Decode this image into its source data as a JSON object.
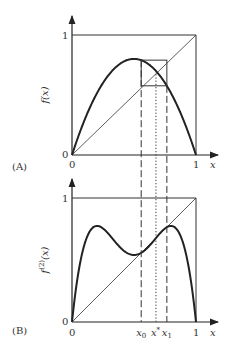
{
  "figure": {
    "panel_a": {
      "tag": "(A)",
      "ylabel": "f(x)",
      "xlabel": "x",
      "y_ticks": [
        "0",
        "1"
      ],
      "x_ticks": [
        "0",
        "1"
      ],
      "map": "logistic",
      "r": 3.1
    },
    "panel_b": {
      "tag": "(B)",
      "ylabel_main": "f",
      "ylabel_sup": "(2)",
      "ylabel_arg": "(x)",
      "xlabel": "x",
      "y_ticks": [
        "0",
        "1"
      ],
      "x_ticks": [
        "0",
        "1"
      ],
      "marked_points": [
        {
          "label": "x",
          "sub": "0",
          "value": 0.558
        },
        {
          "label": "x",
          "sup": "*",
          "value": 0.677
        },
        {
          "label": "x",
          "sub": "1",
          "value": 0.765
        }
      ],
      "map": "second iterate of logistic",
      "r": 3.1
    }
  }
}
